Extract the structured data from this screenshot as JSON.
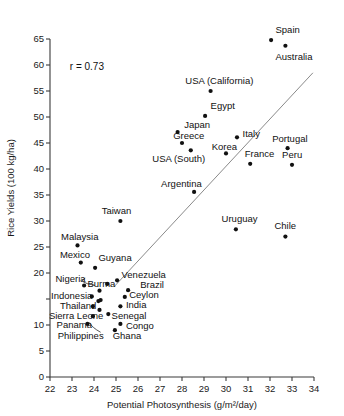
{
  "chart_data": {
    "type": "scatter",
    "title": "",
    "xlabel": "Potential Photosynthesis (g/m²/day)",
    "ylabel": "Rice Yields (100 kg/ha)",
    "xlim": [
      22,
      34
    ],
    "ylim": [
      0,
      65
    ],
    "xticks": [
      22,
      23,
      24,
      25,
      26,
      27,
      28,
      29,
      30,
      31,
      32,
      33,
      34
    ],
    "yticks": [
      0,
      5,
      10,
      15,
      20,
      25,
      30,
      35,
      40,
      45,
      50,
      55,
      60,
      65
    ],
    "xtick_labels": [
      "22",
      "23",
      "24",
      "25",
      "26",
      "27",
      "28",
      "29",
      "30",
      "31",
      "32",
      "33",
      "34"
    ],
    "ytick_labels": [
      "0",
      "5",
      "10",
      "15",
      "20",
      "25",
      "30",
      "35",
      "40",
      "45",
      "50",
      "55",
      "60",
      "65"
    ],
    "ytick_labels_shown": [
      "0",
      "5",
      "10",
      "20",
      "25",
      "30",
      "35",
      "40",
      "45",
      "50",
      "55",
      "60",
      "65"
    ],
    "grid": false,
    "legend": "none",
    "annotations": [
      {
        "text": "r = 0.73",
        "x": 22.9,
        "y": 59.0
      }
    ],
    "fit_line": {
      "x0": 24.9,
      "y0": 17.3,
      "x1": 33.95,
      "y1": 58.5
    },
    "points": [
      {
        "label": "Spain",
        "x": 32.05,
        "y": 64.8,
        "lx": 32.25,
        "ly": 66.8,
        "anchor": "start"
      },
      {
        "label": "Australia",
        "x": 32.7,
        "y": 63.7,
        "lx": 32.25,
        "ly": 61.6,
        "anchor": "start"
      },
      {
        "label": "USA (California)",
        "x": 29.3,
        "y": 55.0,
        "lx": 28.15,
        "ly": 57.0,
        "anchor": "start"
      },
      {
        "label": "Egypt",
        "x": 29.05,
        "y": 50.2,
        "lx": 29.3,
        "ly": 52.2,
        "anchor": "start"
      },
      {
        "label": "Japan",
        "x": 27.8,
        "y": 47.1,
        "lx": 28.1,
        "ly": 48.5,
        "anchor": "start"
      },
      {
        "label": "Greece",
        "x": 28.0,
        "y": 45.0,
        "lx": 27.6,
        "ly": 46.5,
        "anchor": "start"
      },
      {
        "label": "Italy",
        "x": 30.5,
        "y": 46.1,
        "lx": 30.75,
        "ly": 46.9,
        "anchor": "start"
      },
      {
        "label": "Portugal",
        "x": 32.8,
        "y": 44.0,
        "lx": 32.1,
        "ly": 45.8,
        "anchor": "start"
      },
      {
        "label": "Korea",
        "x": 30.0,
        "y": 43.0,
        "lx": 29.35,
        "ly": 44.4,
        "anchor": "start"
      },
      {
        "label": "France",
        "x": 31.1,
        "y": 41.0,
        "lx": 30.85,
        "ly": 43.0,
        "anchor": "start"
      },
      {
        "label": "Peru",
        "x": 33.0,
        "y": 40.8,
        "lx": 32.55,
        "ly": 42.8,
        "anchor": "start"
      },
      {
        "label": "USA (South)",
        "x": 28.4,
        "y": 43.6,
        "lx": 26.65,
        "ly": 42.0,
        "anchor": "start"
      },
      {
        "label": "Argentina",
        "x": 28.55,
        "y": 35.6,
        "lx": 27.05,
        "ly": 37.2,
        "anchor": "start"
      },
      {
        "label": "Uruguay",
        "x": 30.45,
        "y": 28.4,
        "lx": 29.8,
        "ly": 30.4,
        "anchor": "start"
      },
      {
        "label": "Chile",
        "x": 32.7,
        "y": 27.0,
        "lx": 32.2,
        "ly": 29.2,
        "anchor": "start"
      },
      {
        "label": "Taiwan",
        "x": 25.2,
        "y": 30.0,
        "lx": 24.35,
        "ly": 32.0,
        "anchor": "start"
      },
      {
        "label": "Malaysia",
        "x": 23.25,
        "y": 25.3,
        "lx": 22.5,
        "ly": 27.0,
        "anchor": "start"
      },
      {
        "label": "Mexico",
        "x": 23.4,
        "y": 22.0,
        "lx": 22.45,
        "ly": 23.6,
        "anchor": "start"
      },
      {
        "label": "Guyana",
        "x": 24.05,
        "y": 21.0,
        "lx": 24.2,
        "ly": 23.0,
        "anchor": "start"
      },
      {
        "label": "Nigeria",
        "x": 23.55,
        "y": 17.6,
        "lx": 22.25,
        "ly": 19.0,
        "anchor": "start"
      },
      {
        "label": "Burma",
        "x": 24.6,
        "y": 17.9,
        "lx": 23.7,
        "ly": 18.0,
        "anchor": "start"
      },
      {
        "label": "Venezuela",
        "x": 25.05,
        "y": 18.6,
        "lx": 25.25,
        "ly": 19.7,
        "anchor": "start"
      },
      {
        "label": "Brazil",
        "x": 25.55,
        "y": 16.7,
        "lx": 26.1,
        "ly": 17.8,
        "anchor": "start"
      },
      {
        "label": "Ceylon",
        "x": 25.4,
        "y": 15.4,
        "lx": 25.6,
        "ly": 15.9,
        "anchor": "start"
      },
      {
        "label": "Indonesia",
        "x": 23.9,
        "y": 15.5,
        "lx": 22.05,
        "ly": 15.7,
        "anchor": "start"
      },
      {
        "label": "Thailand",
        "x": 23.95,
        "y": 13.6,
        "lx": 22.45,
        "ly": 13.8,
        "anchor": "start"
      },
      {
        "label": "India",
        "x": 25.2,
        "y": 13.6,
        "lx": 25.45,
        "ly": 14.0,
        "anchor": "start"
      },
      {
        "label": "Sierra Leone",
        "x": 23.95,
        "y": 11.7,
        "lx": 21.95,
        "ly": 11.9,
        "anchor": "start"
      },
      {
        "label": "Senegal",
        "x": 24.65,
        "y": 12.1,
        "lx": 24.8,
        "ly": 11.9,
        "anchor": "start"
      },
      {
        "label": "Panama",
        "x": 23.7,
        "y": 10.2,
        "lx": 22.3,
        "ly": 10.1,
        "anchor": "start"
      },
      {
        "label": "Congo",
        "x": 25.2,
        "y": 10.2,
        "lx": 25.45,
        "ly": 9.9,
        "anchor": "start"
      },
      {
        "label": "Ghana",
        "x": 24.95,
        "y": 9.0,
        "lx": 24.85,
        "ly": 7.9,
        "anchor": "start"
      },
      {
        "label": "Philippines",
        "x": 24.2,
        "y": 14.6,
        "lx": 22.35,
        "ly": 7.9,
        "anchor": "start"
      }
    ],
    "extra_unlabeled_points": [
      {
        "x": 24.25,
        "y": 16.6
      },
      {
        "x": 24.3,
        "y": 14.8
      },
      {
        "x": 24.25,
        "y": 12.9
      }
    ],
    "leaders": [
      {
        "from_x": 23.6,
        "from_y": 19.0,
        "to_x": 24.05,
        "to_y": 17.6,
        "curve": true
      },
      {
        "from_x": 24.3,
        "from_y": 8.6,
        "to_x": 23.8,
        "to_y": 10.5,
        "curve": true
      }
    ]
  }
}
